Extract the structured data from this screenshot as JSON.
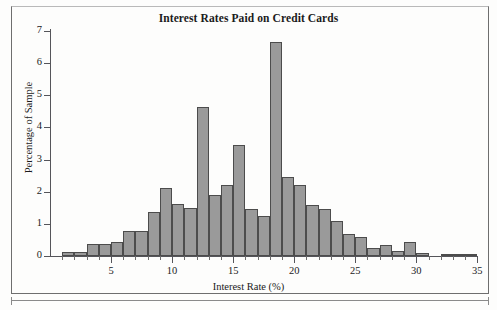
{
  "chart_data": {
    "type": "bar",
    "title": "Interest Rates Paid on Credit Cards",
    "xlabel": "Interest Rate (%)",
    "ylabel": "Percentage of Sample",
    "xlim": [
      0,
      35.5
    ],
    "ylim": [
      0,
      7
    ],
    "grid": false,
    "legend": null,
    "bin_width": 1,
    "xticks": [
      5,
      10,
      15,
      20,
      25,
      30,
      35
    ],
    "yticks": [
      0,
      1,
      2,
      3,
      4,
      5,
      6,
      7
    ],
    "bin_starts": [
      1,
      2,
      3,
      4,
      5,
      6,
      7,
      8,
      9,
      10,
      11,
      12,
      13,
      14,
      15,
      16,
      17,
      18,
      19,
      20,
      21,
      22,
      23,
      24,
      25,
      26,
      27,
      28,
      29,
      30,
      32,
      33,
      34
    ],
    "categories": [
      "1-2",
      "2-3",
      "3-4",
      "4-5",
      "5-6",
      "6-7",
      "7-8",
      "8-9",
      "9-10",
      "10-11",
      "11-12",
      "12-13",
      "13-14",
      "14-15",
      "15-16",
      "16-17",
      "17-18",
      "18-19",
      "19-20",
      "20-21",
      "21-22",
      "22-23",
      "23-24",
      "24-25",
      "25-26",
      "26-27",
      "27-28",
      "28-29",
      "29-30",
      "30-31",
      "32-33",
      "33-34",
      "34-35"
    ],
    "values": [
      0.12,
      0.13,
      0.36,
      0.36,
      0.45,
      0.78,
      0.77,
      1.38,
      2.13,
      1.63,
      1.5,
      4.64,
      1.9,
      2.22,
      3.45,
      1.46,
      1.25,
      6.67,
      2.47,
      2.22,
      1.59,
      1.47,
      1.08,
      0.68,
      0.58,
      0.24,
      0.35,
      0.17,
      0.45,
      0.08,
      0.05,
      0.05,
      0.05
    ]
  },
  "chart": {
    "title": "Interest Rates Paid on Credit Cards",
    "x_axis_title": "Interest Rate (%)",
    "y_axis_title": "Percentage of Sample",
    "x_tick_labels": [
      "5",
      "10",
      "15",
      "20",
      "25",
      "30",
      "35"
    ],
    "y_tick_labels": [
      "0",
      "1",
      "2",
      "3",
      "4",
      "5",
      "6",
      "7"
    ],
    "colors": {
      "bar_fill": "#9a9a9a",
      "bar_outline": "#4c4c4c",
      "axis": "#55555a",
      "text": "#1b1b1b",
      "background": "#fdfdfc",
      "frame": "#6e6e6e"
    }
  }
}
